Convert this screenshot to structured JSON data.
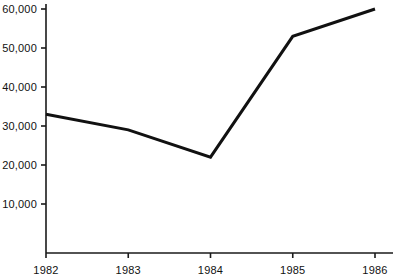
{
  "chart_data": {
    "type": "line",
    "title": "",
    "subtitle": "",
    "xlabel": "",
    "ylabel": "",
    "categories": [
      "1982",
      "1983",
      "1984",
      "1985",
      "1986"
    ],
    "x": [
      1982,
      1983,
      1984,
      1985,
      1986
    ],
    "values": [
      33000,
      29000,
      22000,
      53000,
      60000
    ],
    "series": [
      {
        "name": "",
        "values": [
          33000,
          29000,
          22000,
          53000,
          60000
        ]
      }
    ],
    "ylim": [
      0,
      60000
    ],
    "xlim": [
      1982,
      1986
    ],
    "yticks": [
      10000,
      20000,
      30000,
      40000,
      50000,
      60000
    ],
    "ytick_labels": [
      "10,000",
      "20,000",
      "30,000",
      "40,000",
      "50,000",
      "60,000"
    ],
    "xticks": [
      1982,
      1983,
      1984,
      1985,
      1986
    ],
    "xtick_labels": [
      "1982",
      "1983",
      "1984",
      "1985",
      "1986"
    ],
    "grid": false,
    "legend": false,
    "legend_position": "none",
    "line_color": "#111111",
    "line_width": 3,
    "background_color": "#ffffff",
    "axis_color": "#1a1a1a",
    "markers": false,
    "annotations": []
  },
  "axes": {
    "y_axis_name": "y-axis",
    "x_axis_name": "x-axis"
  }
}
